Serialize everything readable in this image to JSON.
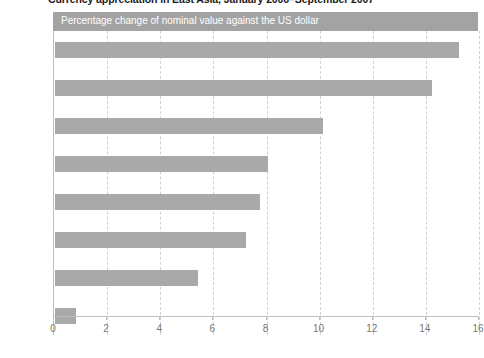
{
  "figure": {
    "title": "Currency appreciation in East Asia, January 2006–September 2007",
    "banner_label": "Percentage change of nominal value against the US dollar",
    "banner_color": "#a3a3a3",
    "bar_color": "#a9a9a9"
  },
  "chart_data": {
    "type": "bar",
    "orientation": "horizontal",
    "title": "Currency appreciation in East Asia, January 2006–September 2007",
    "subtitle": "Percentage change of nominal value against the US dollar",
    "xlabel": "",
    "ylabel": "",
    "categories": [
      "Thailand",
      "Philippines",
      "India",
      "Singapore",
      "Malaysia",
      "China",
      "Korea",
      "Indonesia"
    ],
    "values": [
      15.2,
      14.2,
      10.1,
      8.0,
      7.7,
      7.2,
      5.4,
      0.8
    ],
    "xlim": [
      0,
      16
    ],
    "xticks": [
      0,
      2,
      4,
      6,
      8,
      10,
      12,
      14,
      16
    ],
    "xtick_labels": [
      "0",
      "2",
      "4",
      "6",
      "8",
      "10",
      "12",
      "14",
      "16"
    ],
    "grid": true,
    "legend": false
  }
}
